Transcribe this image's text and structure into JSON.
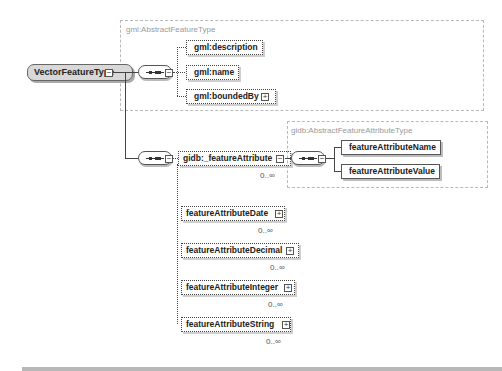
{
  "root": {
    "label": "VectorFeatureType",
    "toggle": "−"
  },
  "abstract_feature_frame": {
    "label": "gml:AbstractFeatureType",
    "children": [
      {
        "label": "gml:description",
        "optional": true,
        "expandable": false
      },
      {
        "label": "gml:name",
        "optional": true,
        "expandable": false
      },
      {
        "label": "gml:boundedBy",
        "optional": true,
        "expandable": true
      }
    ]
  },
  "feature_attribute": {
    "label": "gidb:_featureAttribute",
    "occurrence": "0..∞",
    "toggle": "−",
    "type_frame": {
      "label": "gidb:AbstractFeatureAttributeType",
      "children": [
        {
          "label": "featureAttributeName"
        },
        {
          "label": "featureAttributeValue"
        }
      ]
    },
    "substitutions": [
      {
        "label": "featureAttributeDate",
        "occurrence": "0..∞",
        "toggle": "+"
      },
      {
        "label": "featureAttributeDecimal",
        "occurrence": "0..∞",
        "toggle": "+"
      },
      {
        "label": "featureAttributeInteger",
        "occurrence": "0..∞",
        "toggle": "+"
      },
      {
        "label": "featureAttributeString",
        "occurrence": "0..∞",
        "toggle": "+"
      }
    ]
  },
  "icons": {
    "sequence": "sequence-compositor-icon",
    "expand": "+",
    "collapse": "−"
  }
}
